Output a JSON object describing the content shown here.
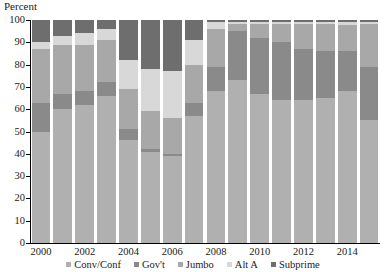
{
  "chart_data": {
    "type": "bar",
    "subtype": "stacked-bar-100",
    "title": "",
    "ylabel": "Percent",
    "xlabel": "",
    "ylim": [
      0,
      100
    ],
    "yticks": [
      0,
      10,
      20,
      30,
      40,
      50,
      60,
      70,
      80,
      90,
      100
    ],
    "grid": false,
    "legend_position": "bottom",
    "categories": [
      "2000",
      "2001",
      "2002",
      "2003",
      "2004",
      "2005",
      "2006",
      "2007",
      "2008",
      "2009",
      "2010",
      "2011",
      "2012",
      "2013",
      "2014",
      "2015"
    ],
    "xtick_labels": [
      "2000",
      "2002",
      "2004",
      "2006",
      "2008",
      "2010",
      "2012",
      "2014"
    ],
    "xtick_categories": [
      "2000",
      "2002",
      "2004",
      "2006",
      "2008",
      "2010",
      "2012",
      "2014"
    ],
    "series": [
      {
        "name": "Conv/Conf",
        "color": "#b0b0b0",
        "values": [
          50,
          60,
          62,
          66,
          46,
          41,
          39,
          57,
          68,
          73,
          67,
          64,
          64,
          65,
          68,
          55
        ]
      },
      {
        "name": "Gov't",
        "color": "#8a8a8a",
        "values": [
          13,
          7,
          6,
          6,
          5,
          1,
          1,
          6,
          11,
          22,
          25,
          26,
          23,
          21,
          18,
          24
        ]
      },
      {
        "name": "Jumbo",
        "color": "#a8a8a8",
        "values": [
          24,
          22,
          21,
          19,
          18,
          17,
          16,
          17,
          17,
          3,
          6,
          8,
          11,
          12,
          12,
          19
        ]
      },
      {
        "name": "Alt A",
        "color": "#d8d8d8",
        "values": [
          3,
          4,
          5,
          5,
          13,
          19,
          21,
          11,
          3,
          1,
          1,
          1,
          1,
          1,
          1,
          1
        ]
      },
      {
        "name": "Subprime",
        "color": "#6e6e6e",
        "values": [
          10,
          7,
          6,
          4,
          18,
          22,
          23,
          9,
          1,
          1,
          1,
          1,
          1,
          1,
          1,
          1
        ]
      }
    ]
  },
  "axis": {
    "y_title": "Percent"
  }
}
